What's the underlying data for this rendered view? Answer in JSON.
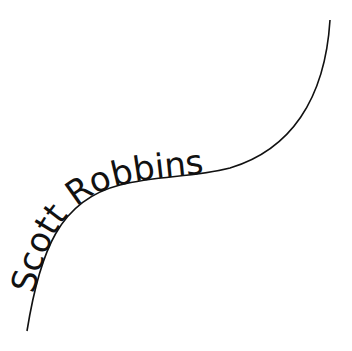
{
  "logo": {
    "text": "Scott Robbins",
    "text_color": "#111111",
    "line_color": "#111111",
    "background": "#ffffff"
  }
}
